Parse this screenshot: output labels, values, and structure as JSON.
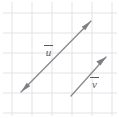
{
  "figure": {
    "width": 119,
    "height": 118,
    "background_color": "#ffffff"
  },
  "grid": {
    "line_color": "#e3e3e6",
    "line_width": 1,
    "cell_size": 20,
    "x_lines": [
      12,
      32,
      52,
      72,
      92,
      112
    ],
    "y_lines": [
      13,
      33,
      53,
      73,
      93,
      113
    ]
  },
  "vectors": [
    {
      "name": "u",
      "label": "u",
      "overbar": true,
      "color": "#8a8a8e",
      "stroke_width": 1.3,
      "double_headed": true,
      "tail": {
        "x": 21,
        "y": 92
      },
      "head": {
        "x": 91,
        "y": 21
      },
      "label_position": {
        "x": 44,
        "y": 45
      },
      "grid_components": {
        "dx": 3.5,
        "dy": 3.55
      }
    },
    {
      "name": "v",
      "label": "v",
      "overbar": true,
      "color": "#8a8a8e",
      "stroke_width": 1.3,
      "double_headed": false,
      "tail": {
        "x": 71,
        "y": 96
      },
      "head": {
        "x": 106,
        "y": 57
      },
      "label_position": {
        "x": 90,
        "y": 77
      },
      "grid_components": {
        "dx": 1.75,
        "dy": 1.95
      }
    }
  ]
}
